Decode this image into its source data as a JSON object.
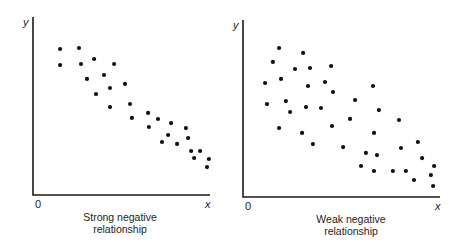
{
  "chart_data": [
    {
      "type": "scatter",
      "title": "Strong negative relationship",
      "caption_lines": [
        "Strong negative",
        "relationship"
      ],
      "xlabel": "x",
      "ylabel": "y",
      "origin_label": "0",
      "xlim": [
        0,
        10
      ],
      "ylim": [
        0,
        10
      ],
      "grid": false,
      "frame": {
        "x0": 33,
        "y0": 195,
        "x1": 210,
        "ytop": 17,
        "caption_x": 120
      },
      "points": [
        [
          1.53,
          8.2
        ],
        [
          2.6,
          8.26
        ],
        [
          1.53,
          7.3
        ],
        [
          2.71,
          7.36
        ],
        [
          3.45,
          7.64
        ],
        [
          4.58,
          7.36
        ],
        [
          3.05,
          6.52
        ],
        [
          4.01,
          6.74
        ],
        [
          4.35,
          6.01
        ],
        [
          3.56,
          5.67
        ],
        [
          5.2,
          6.24
        ],
        [
          4.35,
          4.94
        ],
        [
          5.48,
          5.11
        ],
        [
          5.59,
          4.33
        ],
        [
          6.5,
          4.61
        ],
        [
          7.06,
          4.27
        ],
        [
          6.55,
          3.82
        ],
        [
          7.8,
          4.04
        ],
        [
          7.63,
          3.37
        ],
        [
          7.29,
          2.98
        ],
        [
          8.14,
          2.87
        ],
        [
          8.64,
          3.76
        ],
        [
          8.76,
          3.2
        ],
        [
          8.93,
          2.47
        ],
        [
          9.44,
          2.47
        ],
        [
          9.1,
          2.08
        ],
        [
          9.94,
          2.02
        ],
        [
          9.83,
          1.57
        ]
      ]
    },
    {
      "type": "scatter",
      "title": "Weak negative relationship",
      "caption_lines": [
        "Weak negative",
        "relationship"
      ],
      "xlabel": "x",
      "ylabel": "y",
      "origin_label": "0",
      "xlim": [
        0,
        10
      ],
      "ylim": [
        0,
        10
      ],
      "grid": false,
      "frame": {
        "x0": 243,
        "y0": 197,
        "x1": 440,
        "ytop": 20,
        "caption_x": 351
      },
      "points": [
        [
          1.83,
          8.42
        ],
        [
          3.05,
          8.14
        ],
        [
          1.52,
          7.63
        ],
        [
          2.64,
          7.23
        ],
        [
          3.4,
          7.29
        ],
        [
          4.47,
          7.4
        ],
        [
          1.12,
          6.44
        ],
        [
          1.93,
          6.67
        ],
        [
          3.3,
          6.27
        ],
        [
          4.16,
          6.5
        ],
        [
          4.57,
          5.93
        ],
        [
          6.6,
          6.27
        ],
        [
          1.22,
          5.25
        ],
        [
          2.18,
          5.42
        ],
        [
          2.39,
          4.8
        ],
        [
          3.2,
          5.08
        ],
        [
          3.96,
          5.03
        ],
        [
          5.69,
          5.48
        ],
        [
          6.9,
          4.91
        ],
        [
          1.83,
          3.9
        ],
        [
          3.0,
          3.62
        ],
        [
          4.52,
          4.01
        ],
        [
          5.43,
          4.41
        ],
        [
          7.92,
          4.35
        ],
        [
          3.55,
          2.99
        ],
        [
          5.08,
          2.82
        ],
        [
          6.65,
          3.62
        ],
        [
          6.24,
          2.49
        ],
        [
          6.8,
          2.37
        ],
        [
          8.02,
          2.77
        ],
        [
          8.88,
          3.11
        ],
        [
          9.09,
          2.2
        ],
        [
          5.99,
          1.75
        ],
        [
          6.65,
          1.47
        ],
        [
          7.61,
          1.47
        ],
        [
          8.27,
          1.47
        ],
        [
          8.68,
          0.96
        ],
        [
          9.7,
          1.75
        ],
        [
          9.54,
          1.24
        ],
        [
          9.65,
          0.62
        ]
      ]
    }
  ]
}
